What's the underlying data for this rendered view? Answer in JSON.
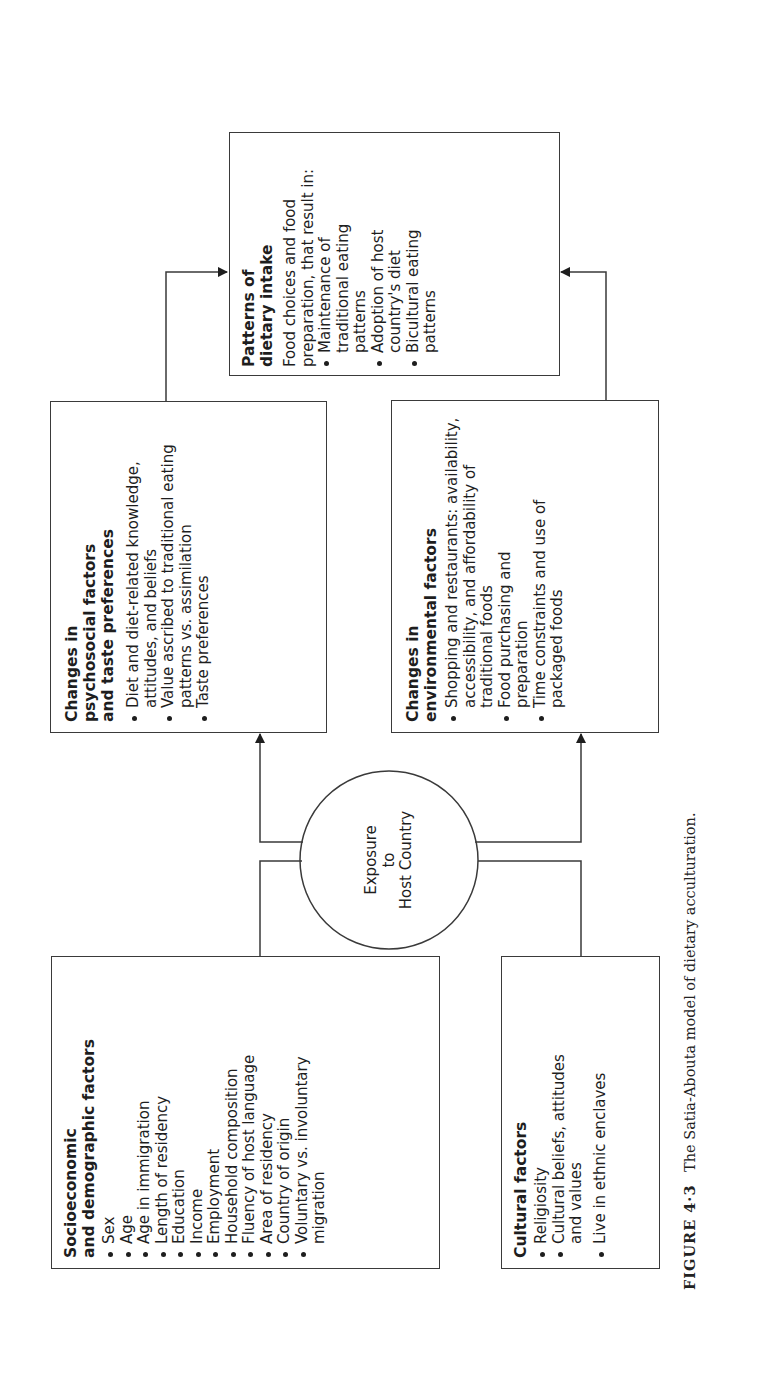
{
  "figure": {
    "caption_label": "FIGURE 4·3",
    "caption_text": "The Satia-Abouta model of dietary acculturation."
  },
  "center": {
    "line1": "Exposure",
    "line2": "to",
    "line3": "Host Country"
  },
  "socioeconomic": {
    "title_line1": "Socioeconomic",
    "title_line2": "and demographic factors",
    "items": [
      "Sex",
      "Age",
      "Age in immigration",
      "Length of residency",
      "Education",
      "Income",
      "Employment",
      "Household composition",
      "Fluency of host language",
      "Area of residency",
      "Country of origin",
      "Voluntary vs. involuntary migration"
    ]
  },
  "cultural": {
    "title": "Cultural factors",
    "items": [
      "Religiosity",
      "Cultural beliefs, attitudes and values",
      "Live in ethnic enclaves"
    ]
  },
  "psychosocial": {
    "title": "Changes in psychosocial factors and taste preferences",
    "items": [
      "Diet and diet-related knowledge, attitudes, and beliefs",
      "Value ascribed to traditional eating patterns vs. assimilation",
      "Taste preferences"
    ]
  },
  "environmental": {
    "title": "Changes in environmental factors",
    "items": [
      "Shopping and restaurants: availability, accessibility, and affordability of traditional foods",
      "Food purchasing and preparation",
      "Time constraints and use of packaged foods"
    ]
  },
  "patterns": {
    "title": "Patterns of dietary intake",
    "intro": "Food choices and food preparation, that result in:",
    "items": [
      "Maintenance of traditional eating patterns",
      "Adoption of host country's diet",
      "Bicultural eating patterns"
    ]
  },
  "colors": {
    "line": "#3a3a3a",
    "text": "#1e1e1e",
    "background": "#ffffff"
  }
}
